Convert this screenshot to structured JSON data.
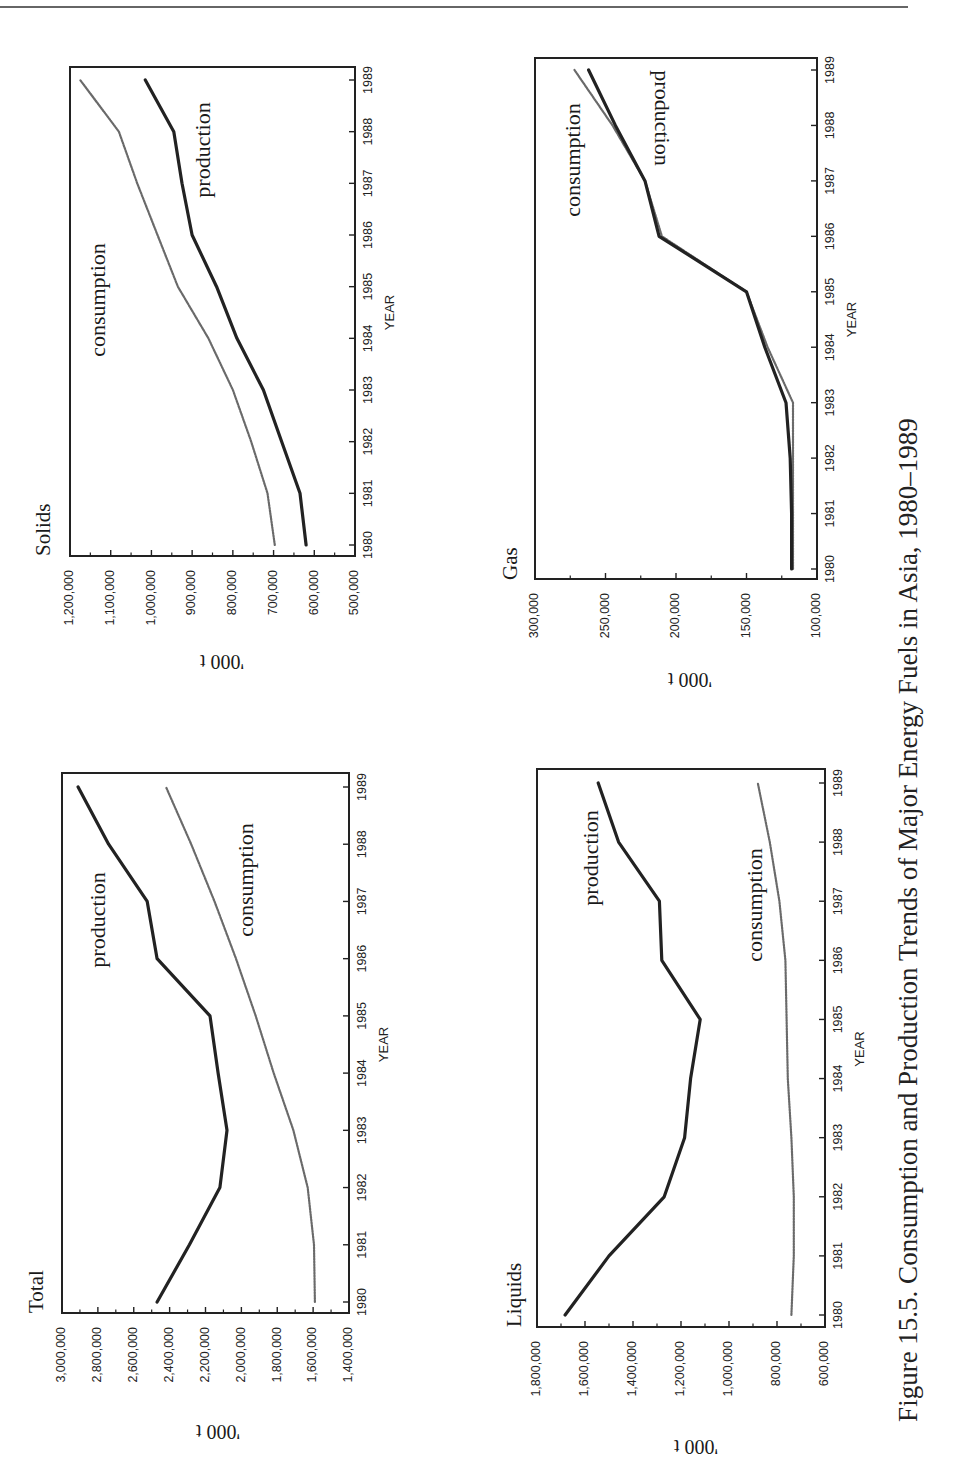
{
  "page": {
    "header_rule": true
  },
  "caption": "Figure 15.5.  Consumption and Production Trends of Major Energy Fuels in Asia, 1980–1989",
  "series_styles": {
    "production": {
      "color": "#222222",
      "width": 3.2,
      "dash": ""
    },
    "consumption": {
      "color": "#6a6a6a",
      "width": 2.2,
      "dash": "1.6 1.2"
    }
  },
  "chart_data": [
    {
      "type": "line",
      "title": "Solids",
      "xlabel": "YEAR",
      "ylabel": "'000 t",
      "ylim": [
        500000,
        1200000
      ],
      "yticks": [
        1200000,
        1100000,
        1000000,
        900000,
        800000,
        700000,
        600000,
        500000
      ],
      "ytick_labels": [
        "1,200,000",
        "1,100,000",
        "1,000,000",
        "900,000",
        "800,000",
        "700,000",
        "600,000",
        "500,000"
      ],
      "categories": [
        "1980",
        "1981",
        "1982",
        "1983",
        "1984",
        "1985",
        "1986",
        "1987",
        "1988",
        "1989"
      ],
      "series": [
        {
          "name": "consumption",
          "values": [
            697000,
            715000,
            755000,
            800000,
            860000,
            935000,
            985000,
            1035000,
            1080000,
            1175000
          ]
        },
        {
          "name": "production",
          "values": [
            620000,
            635000,
            680000,
            725000,
            790000,
            840000,
            900000,
            925000,
            945000,
            1015000
          ]
        }
      ],
      "annotations": [
        {
          "text": "consumption",
          "series": "consumption"
        },
        {
          "text": "production",
          "series": "production"
        }
      ],
      "grid": false
    },
    {
      "type": "line",
      "title": "Gas",
      "xlabel": "YEAR",
      "ylabel": "'000 t",
      "ylim": [
        100000,
        300000
      ],
      "yticks": [
        300000,
        250000,
        200000,
        150000,
        100000
      ],
      "ytick_labels": [
        "300,000",
        "250,000",
        "200,000",
        "150,000",
        "100,000"
      ],
      "categories": [
        "1980",
        "1981",
        "1982",
        "1983",
        "1984",
        "1985",
        "1986",
        "1987",
        "1988",
        "1989"
      ],
      "series": [
        {
          "name": "consumption",
          "values": [
            117000,
            117000,
            117000,
            117000,
            135000,
            150000,
            210000,
            222000,
            245000,
            272000
          ]
        },
        {
          "name": "production",
          "values": [
            118000,
            118000,
            119000,
            122000,
            137000,
            150000,
            212000,
            222000,
            243000,
            262000
          ]
        }
      ],
      "annotations": [
        {
          "text": "consumption",
          "series": "consumption"
        },
        {
          "text": "production",
          "series": "production"
        }
      ],
      "grid": false
    },
    {
      "type": "line",
      "title": "Total",
      "xlabel": "YEAR",
      "ylabel": "'000 t",
      "ylim": [
        1400000,
        3000000
      ],
      "yticks": [
        3000000,
        2800000,
        2600000,
        2400000,
        2200000,
        2000000,
        1800000,
        1600000,
        1400000
      ],
      "ytick_labels": [
        "3,000,000",
        "2,800,000",
        "2,600,000",
        "2,400,000",
        "2,200,000",
        "2,000,000",
        "1,800,000",
        "1,600,000",
        "1,400,000"
      ],
      "categories": [
        "1980",
        "1981",
        "1982",
        "1983",
        "1984",
        "1985",
        "1986",
        "1987",
        "1988",
        "1989"
      ],
      "series": [
        {
          "name": "production",
          "values": [
            2470000,
            2290000,
            2120000,
            2080000,
            2130000,
            2175000,
            2470000,
            2525000,
            2740000,
            2910000
          ]
        },
        {
          "name": "consumption",
          "values": [
            1590000,
            1595000,
            1630000,
            1710000,
            1820000,
            1920000,
            2030000,
            2150000,
            2280000,
            2420000
          ]
        }
      ],
      "annotations": [
        {
          "text": "production",
          "series": "production"
        },
        {
          "text": "consumption",
          "series": "consumption"
        }
      ],
      "grid": false
    },
    {
      "type": "line",
      "title": "Liquids",
      "xlabel": "YEAR",
      "ylabel": "'000 t",
      "ylim": [
        600000,
        1800000
      ],
      "yticks": [
        1800000,
        1600000,
        1400000,
        1200000,
        1000000,
        800000,
        600000
      ],
      "ytick_labels": [
        "1,800,000",
        "1,600,000",
        "1,400,000",
        "1,200,000",
        "1,000,000",
        "800,000",
        "600,000"
      ],
      "categories": [
        "1980",
        "1981",
        "1982",
        "1983",
        "1984",
        "1985",
        "1986",
        "1987",
        "1988",
        "1989"
      ],
      "series": [
        {
          "name": "production",
          "values": [
            1683000,
            1500000,
            1270000,
            1185000,
            1160000,
            1120000,
            1280000,
            1290000,
            1460000,
            1545000
          ]
        },
        {
          "name": "consumption",
          "values": [
            740000,
            730000,
            730000,
            740000,
            755000,
            760000,
            765000,
            790000,
            830000,
            880000
          ]
        }
      ],
      "annotations": [
        {
          "text": "production",
          "series": "production"
        },
        {
          "text": "consumption",
          "series": "consumption"
        }
      ],
      "grid": false
    }
  ]
}
